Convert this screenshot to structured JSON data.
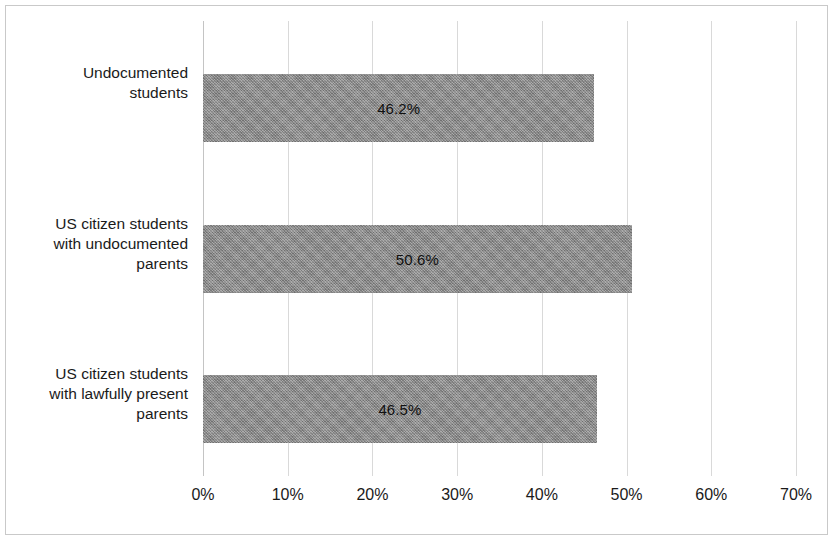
{
  "chart_data": {
    "type": "bar",
    "orientation": "horizontal",
    "title": "",
    "xlabel": "",
    "ylabel": "",
    "xlim": [
      0,
      70
    ],
    "grid": true,
    "legend": false,
    "tick_step": 10,
    "categories": [
      "Undocumented students",
      "US citizen students with undocumented parents",
      "US citizen students with lawfully present parents"
    ],
    "category_lines": [
      [
        "Undocumented",
        "students"
      ],
      [
        "US citizen students",
        "with undocumented",
        "parents"
      ],
      [
        "US citizen students",
        "with lawfully present",
        "parents"
      ]
    ],
    "values": [
      46.2,
      50.6,
      46.5
    ],
    "value_labels": [
      "46.2%",
      "50.6%",
      "46.5%"
    ],
    "xtick_labels": [
      "0%",
      "10%",
      "20%",
      "30%",
      "40%",
      "50%",
      "60%",
      "70%"
    ],
    "xtick_values": [
      0,
      10,
      20,
      30,
      40,
      50,
      60,
      70
    ],
    "bar_color": "#8c8c8c",
    "gridline_color": "#d9d9d9",
    "border_color": "#c9c9c9",
    "text_color": "#1a1a1a",
    "background_color": "#ffffff"
  }
}
